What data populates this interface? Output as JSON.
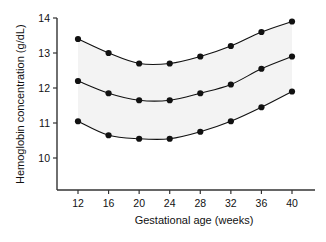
{
  "chart_data": {
    "type": "line",
    "title": "",
    "subtitle": "",
    "xlabel": "Gestational age (weeks)",
    "ylabel": "Hemoglobin concentration (g/dL)",
    "x": [
      12,
      16,
      20,
      24,
      28,
      32,
      36,
      40
    ],
    "xtick_labels": [
      "12",
      "16",
      "20",
      "24",
      "28",
      "32",
      "36",
      "40"
    ],
    "ytick_labels": [
      "10",
      "11",
      "12",
      "13",
      "14"
    ],
    "yticks": [
      10,
      11,
      12,
      13,
      14
    ],
    "xlim": [
      10,
      42
    ],
    "ylim": [
      9.5,
      14
    ],
    "grid": false,
    "legend": null,
    "marker": "filled-circle",
    "band": {
      "label": "reference range band",
      "between": [
        "upper",
        "lower"
      ],
      "fill_color": "#f3f3f3"
    },
    "series": [
      {
        "name": "upper",
        "values": [
          13.4,
          13.0,
          12.7,
          12.7,
          12.9,
          13.2,
          13.6,
          13.9
        ],
        "color": "#111111"
      },
      {
        "name": "median",
        "values": [
          12.2,
          11.85,
          11.65,
          11.65,
          11.85,
          12.1,
          12.55,
          12.9
        ],
        "color": "#111111"
      },
      {
        "name": "lower",
        "values": [
          11.05,
          10.65,
          10.55,
          10.55,
          10.75,
          11.05,
          11.45,
          11.9
        ],
        "color": "#111111"
      }
    ],
    "axis_color": "#333333",
    "background_color": "#ffffff"
  }
}
